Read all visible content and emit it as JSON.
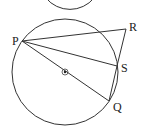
{
  "diagram": {
    "top_arc": {
      "cx": 70,
      "cy": -28,
      "r": 31
    },
    "circle": {
      "cx": 65,
      "cy": 72,
      "r": 53
    },
    "center_mark": {
      "x": 65,
      "y": 72
    },
    "points": {
      "P": {
        "label": "P",
        "x": 22,
        "y": 41,
        "lx": 12,
        "ly": 45
      },
      "R": {
        "label": "R",
        "x": 126,
        "y": 29,
        "lx": 129,
        "ly": 31
      },
      "S": {
        "label": "S",
        "x": 117,
        "y": 66,
        "lx": 121,
        "ly": 72
      },
      "Q": {
        "label": "Q",
        "x": 109,
        "y": 101,
        "lx": 113,
        "ly": 111
      }
    },
    "segments": [
      [
        "P",
        "R"
      ],
      [
        "P",
        "S"
      ],
      [
        "P",
        "Q"
      ],
      [
        "R",
        "S"
      ],
      [
        "S",
        "Q"
      ]
    ]
  }
}
